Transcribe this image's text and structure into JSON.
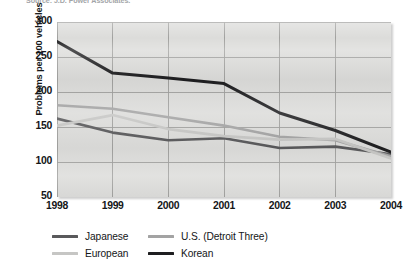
{
  "source_note": "Source: J.D. Power Associates.",
  "axes": {
    "ylabel": "Problems per 100 vehicles",
    "yticks": [
      "300",
      "250",
      "200",
      "150",
      "100",
      "50"
    ],
    "xticks": [
      "1998",
      "1999",
      "2000",
      "2001",
      "2002",
      "2003",
      "2004"
    ]
  },
  "legend": {
    "items": [
      {
        "label": "Japanese",
        "color": "#59595b"
      },
      {
        "label": "U.S. (Detroit Three)",
        "color": "#a3a3a3"
      },
      {
        "label": "European",
        "color": "#c6c6c4"
      },
      {
        "label": "Korean",
        "color": "#1e1e20"
      }
    ]
  },
  "chart_data": {
    "type": "line",
    "title": "",
    "xlabel": "",
    "ylabel": "Problems per 100 vehicles",
    "x": [
      1998,
      1999,
      2000,
      2001,
      2002,
      2003,
      2004
    ],
    "xlim": [
      1998,
      2004
    ],
    "ylim": [
      50,
      300
    ],
    "grid": true,
    "legend_position": "bottom",
    "series": [
      {
        "name": "Japanese",
        "color": "#59595b",
        "values": [
          162,
          142,
          131,
          134,
          120,
          122,
          111
        ]
      },
      {
        "name": "U.S. (Detroit Three)",
        "color": "#a3a3a3",
        "values": [
          181,
          176,
          164,
          152,
          136,
          131,
          108
        ]
      },
      {
        "name": "European",
        "color": "#c6c6c4",
        "values": [
          152,
          167,
          147,
          137,
          132,
          133,
          105
        ]
      },
      {
        "name": "Korean",
        "color": "#1e1e20",
        "values": [
          272,
          227,
          220,
          212,
          170,
          145,
          114
        ]
      }
    ]
  }
}
